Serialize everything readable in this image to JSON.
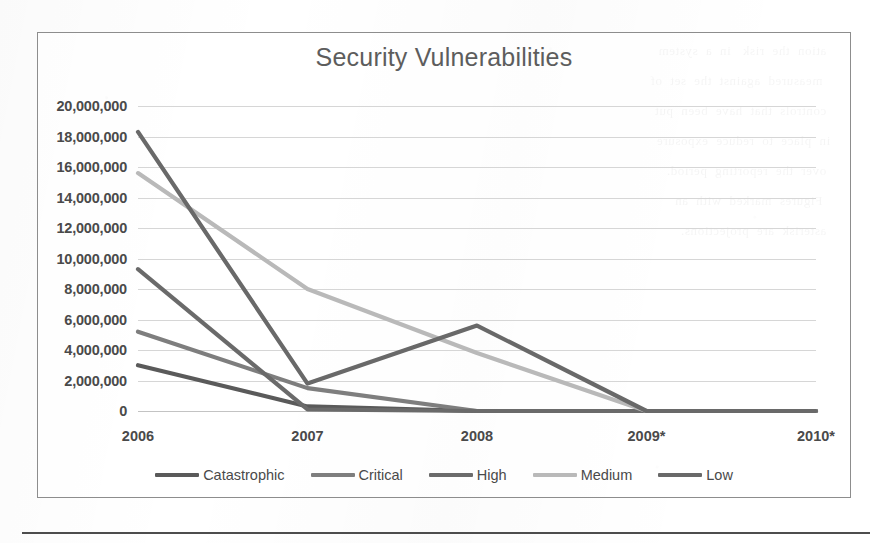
{
  "page": {
    "ghost_text": "  ation  the  risk   in  a  system\n   measured  against  the  set  of\n  controls  that  have  been  put\n in  place  to  reduce  exposure\n  over  the  reporting  period.\n   Figures  marked  with  an\n  asterisk  are  projections."
  },
  "chart": {
    "title": "Security Vulnerabilities",
    "border_color": "#8d8d8d",
    "title_color": "#5d5d5d",
    "tick_color": "#4a4a4a",
    "grid_color": "#d6d6d6"
  },
  "chart_data": {
    "type": "line",
    "title": "Security Vulnerabilities",
    "xlabel": "",
    "ylabel": "",
    "categories": [
      "2006",
      "2007",
      "2008",
      "2009*",
      "2010*"
    ],
    "ylim": [
      0,
      20000000
    ],
    "ytick_step": 2000000,
    "ytick_labels": [
      "20,000,000",
      "18,000,000",
      "16,000,000",
      "14,000,000",
      "12,000,000",
      "10,000,000",
      "8,000,000",
      "6,000,000",
      "4,000,000",
      "2,000,000",
      "0"
    ],
    "ytick_values": [
      20000000,
      18000000,
      16000000,
      14000000,
      12000000,
      10000000,
      8000000,
      6000000,
      4000000,
      2000000,
      0
    ],
    "grid": true,
    "legend_position": "bottom",
    "series": [
      {
        "name": "Catastrophic",
        "color": "#5a5a5a",
        "values": [
          3000000,
          300000,
          0,
          0,
          0
        ]
      },
      {
        "name": "Critical",
        "color": "#7e7e7e",
        "values": [
          5200000,
          1500000,
          0,
          0,
          0
        ]
      },
      {
        "name": "High",
        "color": "#6b6b6b",
        "values": [
          9300000,
          100000,
          0,
          0,
          0
        ]
      },
      {
        "name": "Medium",
        "color": "#b9b9b9",
        "values": [
          15600000,
          8000000,
          3800000,
          0,
          0
        ]
      },
      {
        "name": "Low",
        "color": "#696969",
        "values": [
          18300000,
          1800000,
          5600000,
          0,
          0
        ]
      }
    ]
  }
}
